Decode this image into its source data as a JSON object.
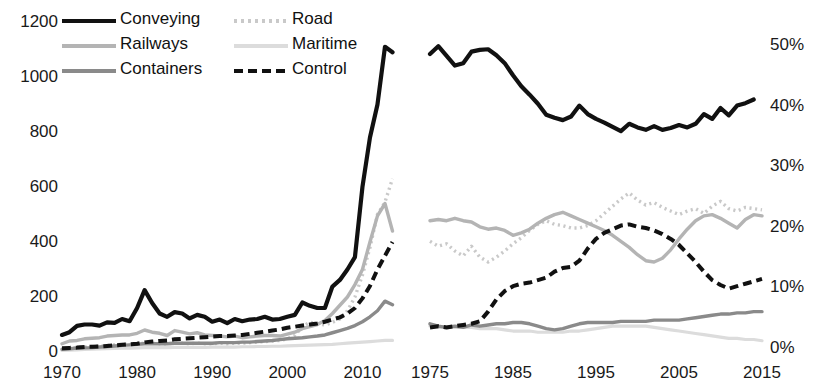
{
  "figure": {
    "type": "multi-panel-line-chart",
    "panel_count": 2
  },
  "legend": {
    "position": "top-left",
    "entries": [
      {
        "label": "Conveying",
        "color": "#111111",
        "style": "solid",
        "width": 4.2
      },
      {
        "label": "Railways",
        "color": "#b4b4b4",
        "style": "solid",
        "width": 3.4
      },
      {
        "label": "Containers",
        "color": "#8a8a8a",
        "style": "solid",
        "width": 3.4
      },
      {
        "label": "Road",
        "color": "#c9c9c9",
        "style": "dotted",
        "width": 3.4
      },
      {
        "label": "Maritime",
        "color": "#dcdcdc",
        "style": "solid",
        "width": 3.2
      },
      {
        "label": "Control",
        "color": "#111111",
        "style": "dashed",
        "width": 4.0
      }
    ]
  },
  "chart_data": [
    {
      "type": "line",
      "panel": "left",
      "title": "",
      "xlabel": "",
      "ylabel": "",
      "xlim": [
        1970,
        2015
      ],
      "ylim": [
        0,
        1200
      ],
      "grid": false,
      "xticks": [
        "1970",
        "1980",
        "1990",
        "2000",
        "2010"
      ],
      "xtick_values": [
        1970,
        1980,
        1990,
        2000,
        2010
      ],
      "yticks": [
        "0",
        "200",
        "400",
        "600",
        "800",
        "1000",
        "1200"
      ],
      "ytick_values": [
        0,
        200,
        400,
        600,
        800,
        1000,
        1200
      ],
      "x": [
        1970,
        1971,
        1972,
        1973,
        1974,
        1975,
        1976,
        1977,
        1978,
        1979,
        1980,
        1981,
        1982,
        1983,
        1984,
        1985,
        1986,
        1987,
        1988,
        1989,
        1990,
        1991,
        1992,
        1993,
        1994,
        1995,
        1996,
        1997,
        1998,
        1999,
        2000,
        2001,
        2002,
        2003,
        2004,
        2005,
        2006,
        2007,
        2008,
        2009,
        2010,
        2011,
        2012,
        2013,
        2014
      ],
      "series": [
        {
          "name": "Conveying",
          "color": "#111111",
          "style": "solid",
          "values": [
            62,
            72,
            95,
            100,
            100,
            96,
            108,
            106,
            120,
            112,
            160,
            225,
            178,
            140,
            128,
            145,
            140,
            122,
            135,
            128,
            110,
            118,
            105,
            120,
            112,
            118,
            120,
            128,
            118,
            120,
            128,
            135,
            180,
            168,
            160,
            160,
            238,
            262,
            300,
            345,
            600,
            780,
            900,
            1110,
            1090
          ]
        },
        {
          "name": "Railways",
          "color": "#b4b4b4",
          "style": "solid",
          "values": [
            30,
            40,
            42,
            48,
            50,
            52,
            58,
            60,
            62,
            62,
            68,
            80,
            72,
            68,
            60,
            78,
            72,
            66,
            70,
            62,
            60,
            58,
            55,
            58,
            52,
            55,
            58,
            60,
            60,
            58,
            65,
            72,
            85,
            92,
            100,
            115,
            140,
            170,
            200,
            245,
            300,
            400,
            495,
            540,
            440
          ]
        },
        {
          "name": "Containers",
          "color": "#8a8a8a",
          "style": "solid",
          "values": [
            10,
            12,
            14,
            15,
            16,
            18,
            20,
            22,
            24,
            26,
            28,
            30,
            30,
            30,
            30,
            32,
            32,
            32,
            32,
            32,
            32,
            34,
            34,
            34,
            36,
            36,
            38,
            40,
            42,
            45,
            48,
            50,
            52,
            55,
            58,
            62,
            70,
            78,
            86,
            96,
            110,
            128,
            150,
            185,
            172
          ]
        },
        {
          "name": "Road",
          "color": "#c9c9c9",
          "style": "dotted",
          "values": [
            12,
            14,
            16,
            18,
            20,
            22,
            24,
            26,
            28,
            28,
            30,
            32,
            32,
            30,
            30,
            32,
            32,
            30,
            32,
            30,
            30,
            32,
            30,
            32,
            32,
            34,
            36,
            38,
            40,
            42,
            48,
            60,
            92,
            108,
            102,
            98,
            108,
            120,
            150,
            200,
            280,
            380,
            500,
            545,
            630
          ]
        },
        {
          "name": "Maritime",
          "color": "#dcdcdc",
          "style": "solid",
          "values": [
            6,
            7,
            8,
            9,
            10,
            11,
            12,
            13,
            14,
            14,
            15,
            16,
            16,
            16,
            16,
            17,
            17,
            17,
            17,
            17,
            18,
            18,
            18,
            18,
            19,
            19,
            20,
            20,
            21,
            21,
            22,
            23,
            24,
            25,
            26,
            27,
            28,
            30,
            32,
            34,
            36,
            38,
            40,
            42,
            42
          ]
        },
        {
          "name": "Control",
          "color": "#111111",
          "style": "dashed",
          "values": [
            14,
            15,
            16,
            18,
            19,
            20,
            22,
            24,
            26,
            28,
            30,
            35,
            38,
            40,
            42,
            46,
            48,
            50,
            52,
            54,
            56,
            58,
            58,
            60,
            62,
            66,
            70,
            74,
            78,
            82,
            88,
            92,
            96,
            100,
            104,
            110,
            118,
            126,
            140,
            160,
            195,
            240,
            300,
            350,
            400
          ]
        }
      ]
    },
    {
      "type": "line",
      "panel": "right",
      "title": "",
      "xlabel": "",
      "ylabel": "",
      "xlim": [
        1975,
        2015
      ],
      "ylim": [
        0,
        0.5
      ],
      "grid": false,
      "xticks": [
        "1975",
        "1985",
        "1995",
        "2005",
        "2015"
      ],
      "xtick_values": [
        1975,
        1985,
        1995,
        2005,
        2015
      ],
      "yticks": [
        "0%",
        "10%",
        "20%",
        "30%",
        "40%",
        "50%"
      ],
      "ytick_values": [
        0,
        10,
        20,
        30,
        40,
        50
      ],
      "unit": "percent",
      "x": [
        1975,
        1976,
        1977,
        1978,
        1979,
        1980,
        1981,
        1982,
        1983,
        1984,
        1985,
        1986,
        1987,
        1988,
        1989,
        1990,
        1991,
        1992,
        1993,
        1994,
        1995,
        1996,
        1997,
        1998,
        1999,
        2000,
        2001,
        2002,
        2003,
        2004,
        2005,
        2006,
        2007,
        2008,
        2009,
        2010,
        2011,
        2012,
        2013,
        2014,
        2015
      ],
      "series": [
        {
          "name": "Conveying",
          "color": "#111111",
          "style": "solid",
          "values": [
            48.5,
            49.8,
            48.2,
            46.6,
            47.0,
            48.9,
            49.2,
            49.3,
            48.3,
            47.0,
            45.0,
            43.2,
            41.8,
            40.3,
            38.5,
            38.0,
            37.6,
            38.2,
            40.0,
            38.6,
            37.8,
            37.2,
            36.5,
            35.8,
            37.0,
            36.4,
            36.0,
            36.6,
            36.0,
            36.3,
            36.8,
            36.4,
            37.0,
            38.6,
            37.8,
            39.6,
            38.4,
            40.0,
            40.4,
            41.0
          ]
        },
        {
          "name": "Railways",
          "color": "#b4b4b4",
          "style": "solid",
          "values": [
            21.0,
            21.2,
            21.0,
            21.4,
            21.0,
            20.8,
            20.0,
            19.6,
            19.8,
            19.4,
            18.6,
            19.0,
            19.6,
            20.6,
            21.4,
            22.0,
            22.4,
            21.8,
            21.2,
            20.6,
            20.0,
            19.4,
            18.6,
            17.6,
            16.6,
            15.4,
            14.4,
            14.2,
            14.8,
            16.2,
            18.0,
            19.6,
            21.0,
            21.8,
            22.0,
            21.4,
            20.6,
            19.8,
            21.2,
            22.0,
            21.8
          ]
        },
        {
          "name": "Road",
          "color": "#c9c9c9",
          "style": "dotted",
          "values": [
            17.6,
            16.8,
            17.2,
            16.0,
            15.2,
            16.8,
            15.0,
            14.2,
            15.0,
            16.0,
            17.2,
            18.2,
            19.4,
            20.4,
            21.0,
            20.4,
            20.2,
            19.8,
            19.8,
            20.2,
            21.0,
            22.2,
            23.4,
            24.6,
            25.6,
            24.4,
            23.6,
            24.0,
            23.2,
            22.6,
            22.0,
            22.6,
            23.0,
            22.2,
            23.4,
            24.2,
            23.0,
            22.6,
            23.2,
            23.0,
            22.8
          ]
        },
        {
          "name": "Containers",
          "color": "#8a8a8a",
          "style": "solid",
          "values": [
            4.0,
            3.6,
            3.4,
            3.6,
            3.4,
            3.8,
            3.6,
            3.8,
            4.0,
            4.0,
            4.2,
            4.2,
            4.0,
            3.6,
            3.2,
            3.0,
            3.2,
            3.6,
            4.0,
            4.2,
            4.2,
            4.2,
            4.2,
            4.4,
            4.4,
            4.4,
            4.4,
            4.6,
            4.6,
            4.6,
            4.6,
            4.8,
            5.0,
            5.2,
            5.4,
            5.6,
            5.6,
            5.8,
            5.8,
            6.0,
            6.0
          ]
        },
        {
          "name": "Maritime",
          "color": "#dcdcdc",
          "style": "solid",
          "values": [
            3.6,
            3.4,
            3.4,
            3.4,
            3.4,
            3.4,
            3.2,
            3.2,
            3.2,
            3.0,
            2.8,
            2.8,
            2.8,
            2.6,
            2.6,
            2.6,
            2.6,
            2.8,
            2.8,
            3.0,
            3.2,
            3.4,
            3.6,
            3.6,
            3.6,
            3.6,
            3.6,
            3.4,
            3.2,
            3.0,
            2.8,
            2.6,
            2.4,
            2.2,
            2.0,
            1.8,
            1.6,
            1.6,
            1.4,
            1.4,
            1.2
          ]
        },
        {
          "name": "Control",
          "color": "#111111",
          "style": "dashed",
          "values": [
            3.4,
            3.6,
            3.4,
            3.6,
            3.8,
            4.0,
            4.4,
            6.0,
            8.0,
            9.4,
            10.2,
            10.6,
            10.8,
            11.2,
            11.6,
            12.6,
            13.2,
            13.4,
            14.4,
            16.4,
            18.0,
            19.0,
            19.6,
            20.2,
            20.4,
            20.0,
            19.8,
            19.4,
            18.8,
            18.0,
            17.0,
            15.6,
            14.2,
            12.6,
            11.2,
            10.4,
            9.8,
            10.2,
            10.6,
            11.0,
            11.4
          ]
        }
      ]
    }
  ]
}
